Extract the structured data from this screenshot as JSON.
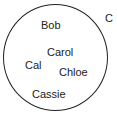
{
  "diagram": {
    "type": "set-diagram",
    "set": {
      "label": "C",
      "members": [
        {
          "name": "Bob"
        },
        {
          "name": "Carol"
        },
        {
          "name": "Cal"
        },
        {
          "name": "Chloe"
        },
        {
          "name": "Cassie"
        }
      ]
    },
    "colors": {
      "stroke": "#222222",
      "text": "#222222",
      "background": "#ffffff"
    }
  }
}
